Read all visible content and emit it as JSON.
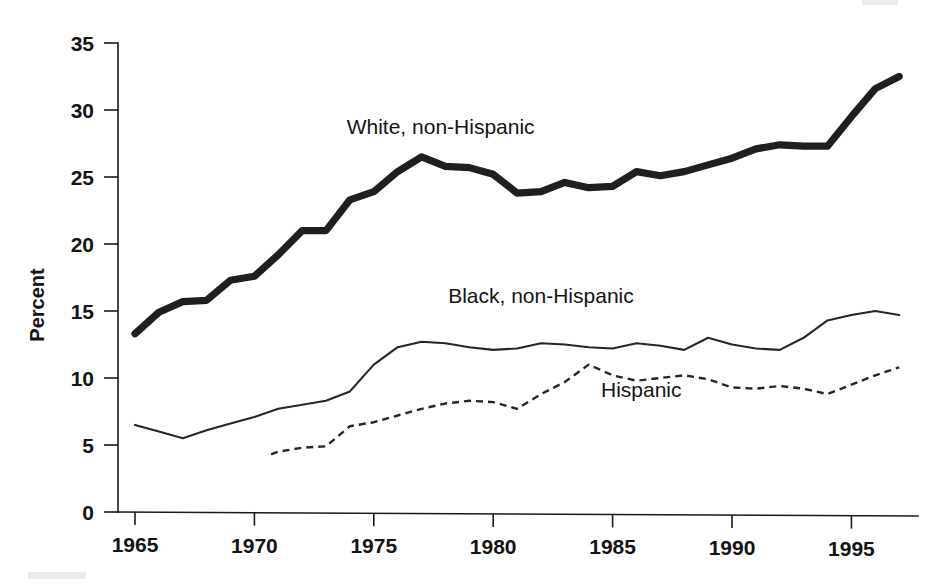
{
  "chart_data": {
    "type": "line",
    "title": "",
    "xlabel": "",
    "ylabel": "Percent",
    "xlim": [
      1965,
      1997
    ],
    "ylim": [
      0,
      35
    ],
    "grid": false,
    "legend_position": "inline-annotations",
    "x_ticks": [
      "1965",
      "1970",
      "1975",
      "1980",
      "1985",
      "1990",
      "1995"
    ],
    "x_tick_values": [
      1965,
      1970,
      1975,
      1980,
      1985,
      1990,
      1995
    ],
    "y_ticks": [
      "0",
      "5",
      "10",
      "15",
      "20",
      "25",
      "30",
      "35"
    ],
    "y_tick_values": [
      0,
      5,
      10,
      15,
      20,
      25,
      30,
      35
    ],
    "series": [
      {
        "name": "White, non-Hispanic",
        "style": "thick-solid",
        "label_x": 1977.8,
        "label_y": 28.2,
        "x": [
          1965,
          1966,
          1967,
          1968,
          1969,
          1970,
          1971,
          1972,
          1973,
          1974,
          1975,
          1976,
          1977,
          1978,
          1979,
          1980,
          1981,
          1982,
          1983,
          1984,
          1985,
          1986,
          1987,
          1988,
          1989,
          1990,
          1991,
          1992,
          1993,
          1994,
          1995,
          1996,
          1997
        ],
        "values": [
          13.3,
          14.9,
          15.7,
          15.8,
          17.3,
          17.6,
          19.2,
          21.0,
          21.0,
          23.3,
          23.9,
          25.4,
          26.5,
          25.8,
          25.7,
          25.2,
          23.8,
          23.9,
          24.6,
          24.2,
          24.3,
          25.4,
          25.1,
          25.4,
          25.9,
          26.4,
          27.1,
          27.4,
          27.3,
          27.3,
          29.5,
          31.6,
          32.5
        ]
      },
      {
        "name": "Black, non-Hispanic",
        "style": "thin-solid",
        "label_x": 1982.0,
        "label_y": 15.6,
        "x": [
          1965,
          1966,
          1967,
          1968,
          1969,
          1970,
          1971,
          1972,
          1973,
          1974,
          1975,
          1976,
          1977,
          1978,
          1979,
          1980,
          1981,
          1982,
          1983,
          1984,
          1985,
          1986,
          1987,
          1988,
          1989,
          1990,
          1991,
          1992,
          1993,
          1994,
          1995,
          1996,
          1997
        ],
        "values": [
          6.5,
          6.0,
          5.5,
          6.1,
          6.6,
          7.1,
          7.7,
          8.0,
          8.3,
          9.0,
          11.0,
          12.3,
          12.7,
          12.6,
          12.3,
          12.1,
          12.2,
          12.6,
          12.5,
          12.3,
          12.2,
          12.6,
          12.4,
          12.1,
          13.0,
          12.5,
          12.2,
          12.1,
          13.0,
          14.3,
          14.7,
          15.0,
          14.7
        ]
      },
      {
        "name": "Hispanic",
        "style": "dashed",
        "label_x": 1986.2,
        "label_y": 8.6,
        "x": [
          1970.7,
          1971,
          1972,
          1973,
          1974,
          1975,
          1976,
          1977,
          1978,
          1979,
          1980,
          1981,
          1982,
          1983,
          1984,
          1985,
          1986,
          1987,
          1988,
          1989,
          1990,
          1991,
          1992,
          1993,
          1994,
          1995,
          1996,
          1997
        ],
        "values": [
          4.3,
          4.5,
          4.8,
          4.9,
          6.4,
          6.7,
          7.2,
          7.7,
          8.1,
          8.3,
          8.2,
          7.7,
          8.8,
          9.7,
          11.0,
          10.2,
          9.8,
          10.0,
          10.2,
          9.9,
          9.3,
          9.2,
          9.4,
          9.2,
          8.8,
          9.5,
          10.2,
          10.8
        ]
      }
    ]
  },
  "axes": {
    "ylabel": "Percent"
  }
}
